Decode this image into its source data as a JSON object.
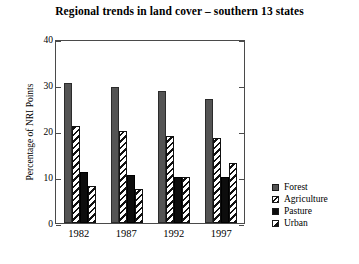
{
  "chart_data": {
    "type": "bar",
    "title": "Regional trends in land cover – southern 13 states",
    "xlabel": "",
    "ylabel": "Percentage of NRI Points",
    "categories": [
      "1982",
      "1987",
      "1992",
      "1997"
    ],
    "ylim": [
      0,
      40
    ],
    "yticks": [
      0,
      10,
      20,
      30,
      40
    ],
    "grid": false,
    "legend_position": "right",
    "series": [
      {
        "name": "Forest",
        "values": [
          30.5,
          29.5,
          28.8,
          27.0
        ],
        "color": "#545454",
        "pattern": "solid-gray"
      },
      {
        "name": "Agriculture",
        "values": [
          21.0,
          20.0,
          19.0,
          18.5
        ],
        "color": "#111111",
        "pattern": "diagonal-hatch"
      },
      {
        "name": "Pasture",
        "values": [
          11.0,
          10.5,
          10.0,
          10.0
        ],
        "color": "#0d0d0d",
        "pattern": "solid-black"
      },
      {
        "name": "Urban",
        "values": [
          8.0,
          7.5,
          10.0,
          13.0
        ],
        "color": "#111111",
        "pattern": "diagonal-hatch-light"
      }
    ]
  },
  "ytick_labels": [
    "40",
    "30",
    "20",
    "10",
    "0"
  ],
  "legend": {
    "items": [
      {
        "label": "Forest"
      },
      {
        "label": "Agriculture"
      },
      {
        "label": "Pasture"
      },
      {
        "label": "Urban"
      }
    ]
  }
}
